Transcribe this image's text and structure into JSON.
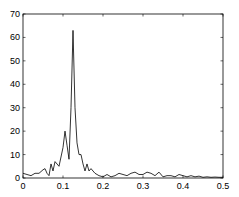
{
  "chart_data": {
    "type": "line",
    "title": "",
    "xlabel": "",
    "ylabel": "",
    "xlim": [
      0,
      0.5
    ],
    "ylim": [
      0,
      70
    ],
    "grid": false,
    "legend": null,
    "x_ticks": [
      0,
      0.1,
      0.2,
      0.3,
      0.4,
      0.5
    ],
    "x_tick_labels": [
      "0",
      "0.1",
      "0.2",
      "0.3",
      "0.4",
      "0.5"
    ],
    "y_ticks": [
      0,
      10,
      20,
      30,
      40,
      50,
      60,
      70
    ],
    "y_tick_labels": [
      "0",
      "10",
      "20",
      "30",
      "40",
      "50",
      "60",
      "70"
    ],
    "series": [
      {
        "name": "spectrum",
        "color": "#000000",
        "x": [
          0,
          0.01,
          0.02,
          0.03,
          0.04,
          0.05,
          0.055,
          0.06,
          0.065,
          0.07,
          0.075,
          0.08,
          0.09,
          0.1,
          0.105,
          0.11,
          0.115,
          0.12,
          0.125,
          0.13,
          0.135,
          0.14,
          0.145,
          0.15,
          0.155,
          0.16,
          0.165,
          0.17,
          0.18,
          0.19,
          0.2,
          0.21,
          0.22,
          0.23,
          0.24,
          0.25,
          0.26,
          0.27,
          0.28,
          0.29,
          0.3,
          0.31,
          0.32,
          0.33,
          0.34,
          0.35,
          0.36,
          0.37,
          0.38,
          0.39,
          0.4,
          0.41,
          0.42,
          0.43,
          0.44,
          0.45,
          0.46,
          0.47,
          0.48,
          0.49,
          0.5
        ],
        "y": [
          2,
          1.5,
          1,
          2,
          2,
          3.5,
          4,
          2,
          1,
          6,
          3,
          7,
          5,
          13,
          20,
          14,
          8,
          30,
          63,
          30,
          15,
          10,
          10,
          6,
          3,
          6,
          3,
          4,
          2,
          1,
          0.5,
          1.5,
          0.5,
          1,
          2,
          1.5,
          1,
          2,
          2.5,
          1.5,
          1.5,
          2.5,
          2,
          1,
          2.5,
          0.5,
          1,
          1,
          0.5,
          1.5,
          1,
          0.5,
          1,
          0.5,
          0.8,
          0.3,
          0.5,
          0.3,
          0.4,
          0.3,
          0.3
        ]
      }
    ]
  }
}
